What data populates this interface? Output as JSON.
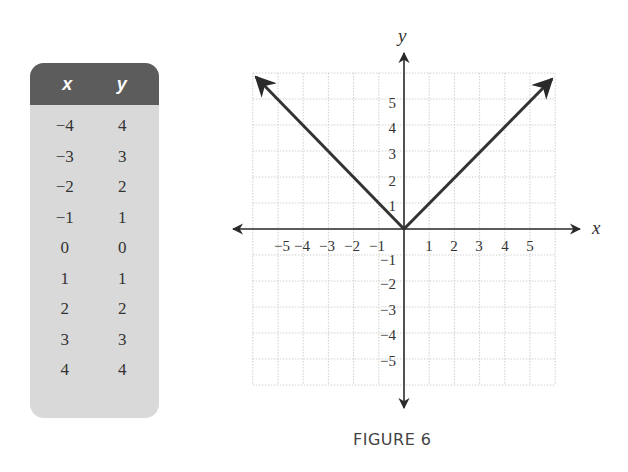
{
  "table": {
    "headers": {
      "x": "x",
      "y": "y"
    },
    "rows": [
      {
        "x": "−4",
        "y": "4"
      },
      {
        "x": "−3",
        "y": "3"
      },
      {
        "x": "−2",
        "y": "2"
      },
      {
        "x": "−1",
        "y": "1"
      },
      {
        "x": "0",
        "y": "0"
      },
      {
        "x": "1",
        "y": "1"
      },
      {
        "x": "2",
        "y": "2"
      },
      {
        "x": "3",
        "y": "3"
      },
      {
        "x": "4",
        "y": "4"
      }
    ]
  },
  "graph": {
    "x_axis_label": "x",
    "y_axis_label": "y",
    "x_ticks": [
      "−5",
      "−4",
      "−3",
      "−2",
      "−1",
      "1",
      "2",
      "3",
      "4",
      "5"
    ],
    "y_ticks_pos": [
      "1",
      "2",
      "3",
      "4",
      "5"
    ],
    "y_ticks_neg": [
      "−1",
      "−2",
      "−3",
      "−4",
      "−5"
    ]
  },
  "caption": "FIGURE 6",
  "chart_data": {
    "type": "line",
    "title": "FIGURE 6",
    "xlabel": "x",
    "ylabel": "y",
    "function": "y = |x|",
    "x": [
      -4,
      -3,
      -2,
      -1,
      0,
      1,
      2,
      3,
      4
    ],
    "series": [
      {
        "name": "y = |x|",
        "values": [
          4,
          3,
          2,
          1,
          0,
          1,
          2,
          3,
          4
        ]
      }
    ],
    "xlim": [
      -6,
      6
    ],
    "ylim": [
      -6,
      6
    ],
    "x_tick_labels": [
      -5,
      -4,
      -3,
      -2,
      -1,
      1,
      2,
      3,
      4,
      5
    ],
    "y_tick_labels": [
      -5,
      -4,
      -3,
      -2,
      -1,
      1,
      2,
      3,
      4,
      5
    ],
    "grid": true,
    "legend": "none",
    "colors": {
      "line": "#333333",
      "grid": "#cccccc",
      "table_header": "#5c5c5c",
      "table_body": "#d9d9d9"
    }
  }
}
